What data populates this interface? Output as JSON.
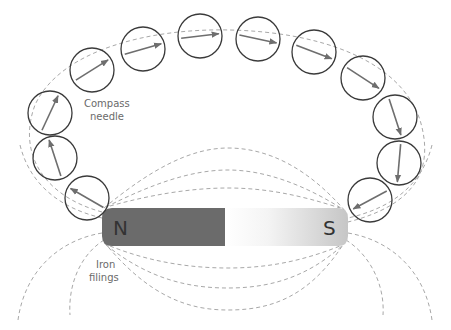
{
  "diagram": {
    "labels": {
      "compass_line1": "Compass",
      "compass_line2": "needle",
      "iron_line1": "Iron",
      "iron_line2": "filings"
    },
    "magnet": {
      "north_label": "N",
      "south_label": "S",
      "north_color": "#6b6b6b",
      "south_color_start": "#ffffff",
      "south_color_end": "#c8c8c8"
    },
    "colors": {
      "circle_stroke": "#3a3a3a",
      "needle": "#6e6e6e",
      "field_line": "#a8a8a8"
    },
    "compasses": [
      {
        "cx": 87,
        "cy": 198,
        "angle": -150
      },
      {
        "cx": 55,
        "cy": 158,
        "angle": -108
      },
      {
        "cx": 50,
        "cy": 113,
        "angle": -65
      },
      {
        "cx": 92,
        "cy": 70,
        "angle": -32
      },
      {
        "cx": 143,
        "cy": 49,
        "angle": -16
      },
      {
        "cx": 200,
        "cy": 36,
        "angle": -7
      },
      {
        "cx": 258,
        "cy": 39,
        "angle": 12
      },
      {
        "cx": 314,
        "cy": 52,
        "angle": 21
      },
      {
        "cx": 363,
        "cy": 78,
        "angle": 33
      },
      {
        "cx": 395,
        "cy": 117,
        "angle": 72
      },
      {
        "cx": 399,
        "cy": 163,
        "angle": 95
      },
      {
        "cx": 370,
        "cy": 200,
        "angle": 152
      }
    ]
  }
}
